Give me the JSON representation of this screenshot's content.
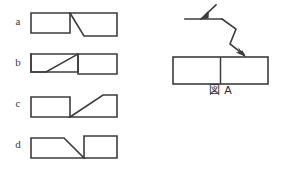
{
  "page": {
    "type": "multiple-choice-figure-question",
    "language": "ja",
    "background_color": "#ffffff",
    "line_color": "#3d3d3d",
    "text_color": "#2b2b2b"
  },
  "options": {
    "panel_name": "answer-options",
    "items": [
      {
        "label": "a",
        "description": "rectangle split by a diagonal running from top-middle down to the right, right half shifted downward",
        "diagonal_direction": "down-right"
      },
      {
        "label": "b",
        "description": "rectangle split by a diagonal running from lower-middle up to the right, left half shifted downward",
        "diagonal_direction": "up-right"
      },
      {
        "label": "c",
        "description": "rectangle split by a diagonal running from bottom-middle up to the right, right half shifted upward",
        "diagonal_direction": "up-right"
      },
      {
        "label": "d",
        "description": "rectangle split by a diagonal running from top-middle down to the right, right half shifted upward",
        "diagonal_direction": "down-right"
      }
    ]
  },
  "figure": {
    "panel_name": "reference-figure",
    "caption": "図 A",
    "caption_parts": {
      "kanji": "図",
      "letter": "A"
    },
    "arrow_count": 2
  }
}
